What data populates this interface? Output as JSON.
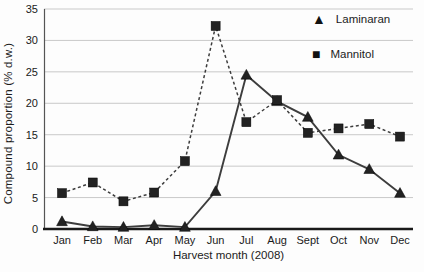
{
  "chart_data": {
    "type": "line",
    "title": "",
    "xlabel": "Harvest month (2008)",
    "ylabel": "Compound proportion (% d.w.)",
    "categories": [
      "Jan",
      "Feb",
      "Mar",
      "Apr",
      "May",
      "Jun",
      "Jul",
      "Aug",
      "Sept",
      "Oct",
      "Nov",
      "Dec"
    ],
    "ylim": [
      0,
      35
    ],
    "yticks": [
      0,
      5,
      10,
      15,
      20,
      25,
      30,
      35
    ],
    "grid": "horizontal",
    "legend_position": "top-right-inside",
    "colors": {
      "line": "#3d3d3d",
      "marker": "#222222",
      "gridline": "#c9c9c9",
      "axis": "#1a1a1a",
      "text": "#1a1a1a"
    },
    "series": [
      {
        "name": "Laminaran",
        "marker": "triangle",
        "line_style": "solid",
        "values": [
          1.2,
          0.4,
          0.3,
          0.6,
          0.3,
          6.0,
          24.5,
          20.3,
          17.8,
          11.8,
          9.5,
          5.7
        ]
      },
      {
        "name": "Mannitol",
        "marker": "square",
        "line_style": "dashed",
        "values": [
          5.7,
          7.4,
          4.4,
          5.8,
          10.8,
          32.3,
          17.0,
          20.5,
          15.3,
          16.0,
          16.7,
          14.7
        ]
      }
    ],
    "legend_markers": {
      "triangle": "▲",
      "square": "■"
    }
  }
}
